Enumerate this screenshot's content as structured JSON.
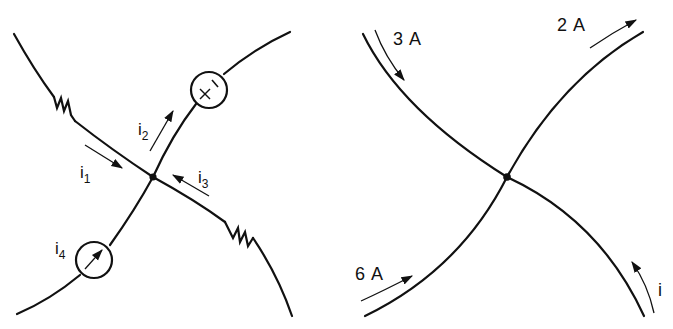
{
  "figure": {
    "left_panel": {
      "description": "Circuit node with four branches",
      "currents": [
        {
          "id": "i1",
          "label": "i",
          "subscript": "1",
          "direction": "into node"
        },
        {
          "id": "i2",
          "label": "i",
          "subscript": "2",
          "direction": "out of node"
        },
        {
          "id": "i3",
          "label": "i",
          "subscript": "3",
          "direction": "into node"
        },
        {
          "id": "i4",
          "label": "i",
          "subscript": "4",
          "direction": "into node (current source)"
        }
      ],
      "elements": [
        {
          "type": "resistor",
          "branch": "upper-left"
        },
        {
          "type": "voltage-source",
          "branch": "upper-right",
          "polarity": "+ -"
        },
        {
          "type": "current-source",
          "branch": "lower-left"
        },
        {
          "type": "resistor",
          "branch": "lower-right"
        }
      ],
      "voltage_source_symbols": {
        "plus": "+",
        "minus": "−"
      }
    },
    "right_panel": {
      "description": "Node with known branch currents",
      "currents": [
        {
          "label": "3 A",
          "branch": "upper-left",
          "direction": "into node"
        },
        {
          "label": "2 A",
          "branch": "upper-right",
          "direction": "out of node"
        },
        {
          "label": "6 A",
          "branch": "lower-left",
          "direction": "into node"
        },
        {
          "label": "i",
          "branch": "lower-right",
          "direction": "out of node"
        }
      ]
    },
    "colors": {
      "ink": "#111111",
      "background": "#ffffff"
    }
  }
}
